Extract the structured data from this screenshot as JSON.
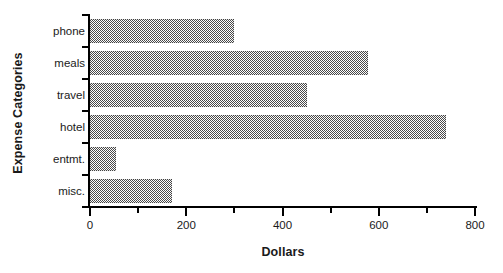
{
  "chart_data": {
    "type": "bar",
    "orientation": "horizontal",
    "title": "",
    "xlabel": "Dollars",
    "ylabel": "Expense Categories",
    "categories": [
      "phone",
      "meals",
      "travel",
      "hotel",
      "entmt.",
      "misc."
    ],
    "values": [
      300,
      578,
      450,
      740,
      55,
      170
    ],
    "xlim": [
      0,
      800
    ],
    "xticks": [
      0,
      200,
      400,
      600,
      800
    ],
    "xtick_labels": [
      "0",
      "200",
      "400",
      "600",
      "800"
    ],
    "xticks_minor": [
      100,
      300,
      500,
      700
    ],
    "grid": false,
    "legend": false,
    "bar_fill": "#808080",
    "bar_pattern": "50-percent-checkerboard-dither",
    "axis_color": "#000000"
  }
}
